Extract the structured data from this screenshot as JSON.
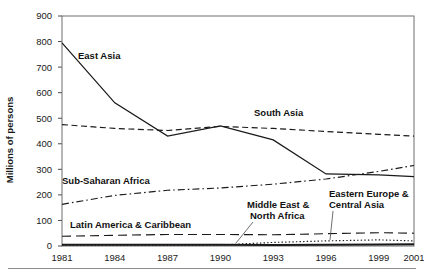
{
  "chart_data": {
    "type": "line",
    "title": "",
    "xlabel": "",
    "ylabel": "Millions of persons",
    "x": [
      1981,
      1984,
      1987,
      1990,
      1993,
      1996,
      1999,
      2001
    ],
    "xticklabels": [
      "1981",
      "1984",
      "1987",
      "1990",
      "1993",
      "1996",
      "1999",
      "2001"
    ],
    "yticklabels": [
      "0",
      "100",
      "200",
      "300",
      "400",
      "500",
      "600",
      "700",
      "800",
      "900"
    ],
    "ylim": [
      0,
      900
    ],
    "xlim": [
      1981,
      2001
    ],
    "ytick_step": 100,
    "grid": false,
    "legend": "inline-labels",
    "series": [
      {
        "name": "East Asia",
        "style": "solid",
        "values": [
          795,
          560,
          430,
          470,
          415,
          282,
          278,
          271
        ]
      },
      {
        "name": "South Asia",
        "style": "dashed",
        "values": [
          475,
          460,
          452,
          468,
          460,
          448,
          437,
          430
        ]
      },
      {
        "name": "Sub-Saharan Africa",
        "style": "dash-dot",
        "values": [
          163,
          198,
          218,
          227,
          242,
          262,
          292,
          315
        ]
      },
      {
        "name": "Latin America & Caribbean",
        "style": "long-dash",
        "values": [
          38,
          42,
          45,
          45,
          44,
          48,
          52,
          50
        ]
      },
      {
        "name": "Middle East & North Africa",
        "style": "solid-thick",
        "values": [
          5,
          5,
          5,
          5,
          4,
          5,
          6,
          7
        ]
      },
      {
        "name": "Eastern Europe & Central Asia",
        "style": "dotted",
        "values": [
          3,
          3,
          3,
          4,
          14,
          20,
          24,
          20
        ]
      }
    ],
    "annotations": [
      {
        "text": "East Asia",
        "x_px": 78,
        "y_px": 59,
        "leader": false
      },
      {
        "text": "South Asia",
        "x_px": 254,
        "y_px": 116,
        "leader": false
      },
      {
        "text": "Sub-Saharan Africa",
        "x_px": 62,
        "y_px": 184,
        "leader": false
      },
      {
        "text": "Latin America & Caribbean",
        "x_px": 70,
        "y_px": 228,
        "leader": false
      },
      {
        "text": "Middle East &",
        "x_px": 247,
        "y_px": 208,
        "leader": true
      },
      {
        "text": "North Africa",
        "x_px": 250,
        "y_px": 219,
        "leader": false
      },
      {
        "text": "Eastern Europe &",
        "x_px": 329,
        "y_px": 197,
        "leader": true
      },
      {
        "text": "Central Asia",
        "x_px": 329,
        "y_px": 208,
        "leader": false
      }
    ]
  }
}
